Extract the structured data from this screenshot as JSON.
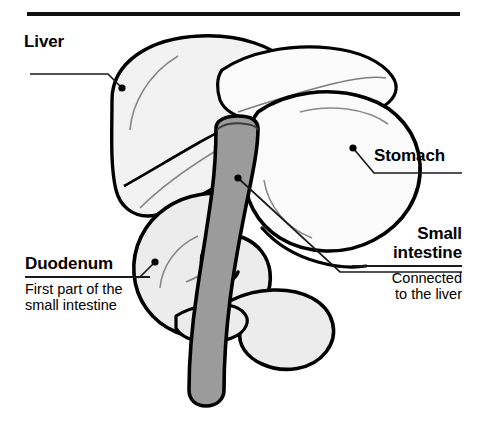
{
  "figure": {
    "type": "anatomical-diagram",
    "background_color": "#ffffff",
    "ink_color": "#000000",
    "top_rule": true
  },
  "palette": {
    "outline": "#000000",
    "liver_fill": "#f2f2f2",
    "stomach_fill": "#fbfbfb",
    "duodenum_fill": "#ececec",
    "small_intestine_fill": "#9b9b9b",
    "rule": "#1a1a1a",
    "text": "#000000"
  },
  "labels": [
    {
      "id": "liver",
      "title": "Liver",
      "subtitle": "",
      "align": "left",
      "rule_width": 120,
      "x": 24,
      "y": 32
    },
    {
      "id": "stomach",
      "title": "Stomach",
      "subtitle": "",
      "align": "left",
      "rule_width": 105,
      "x": 374,
      "y": 147
    },
    {
      "id": "small-intestine",
      "title": "Small\nintestine",
      "title_line_1": "Small",
      "title_line_2": "intestine",
      "subtitle_line_1": "Connected",
      "subtitle_line_2": "to the liver",
      "align": "right",
      "rule_width": 105,
      "x": 363,
      "y": 226
    },
    {
      "id": "duodenum",
      "title": "Duodenum",
      "subtitle_line_1": "First part of the",
      "subtitle_line_2": "small intestine",
      "align": "left",
      "rule_width": 122,
      "x": 25,
      "y": 255
    }
  ],
  "leaders": [
    {
      "id": "liver-leader",
      "dot_x": 122,
      "dot_y": 88
    },
    {
      "id": "stomach-leader",
      "dot_x": 353,
      "dot_y": 148
    },
    {
      "id": "small-intestine-leader",
      "dot_x": 238,
      "dot_y": 178
    },
    {
      "id": "duodenum-leader",
      "dot_x": 155,
      "dot_y": 262
    }
  ],
  "organs": [
    {
      "id": "liver",
      "name": "Liver",
      "shade": "light"
    },
    {
      "id": "stomach",
      "name": "Stomach",
      "shade": "light"
    },
    {
      "id": "duodenum",
      "name": "Duodenum",
      "shade": "light"
    },
    {
      "id": "small-intestine",
      "name": "Small intestine",
      "shade": "dark-gray"
    }
  ]
}
